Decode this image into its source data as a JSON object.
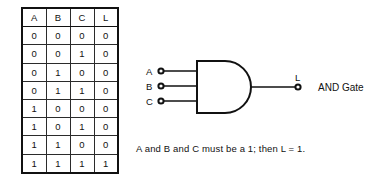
{
  "truth_table": {
    "columns": [
      "A",
      "B",
      "C",
      "L"
    ],
    "rows": [
      [
        "0",
        "0",
        "0",
        "0"
      ],
      [
        "0",
        "0",
        "1",
        "0"
      ],
      [
        "0",
        "1",
        "0",
        "0"
      ],
      [
        "0",
        "1",
        "1",
        "0"
      ],
      [
        "1",
        "0",
        "0",
        "0"
      ],
      [
        "1",
        "0",
        "1",
        "0"
      ],
      [
        "1",
        "1",
        "0",
        "0"
      ],
      [
        "1",
        "1",
        "1",
        "1"
      ]
    ]
  },
  "gate": {
    "type": "AND",
    "name_label": "AND Gate",
    "input_labels": [
      "A",
      "B",
      "C"
    ],
    "output_label": "L",
    "icon": "and-gate-icon"
  },
  "caption": {
    "text": "A and B and C must be a 1; then L = 1."
  },
  "colors": {
    "background": "#ffffff",
    "ink": "#111111",
    "grid_line": "#2b2b2b"
  }
}
